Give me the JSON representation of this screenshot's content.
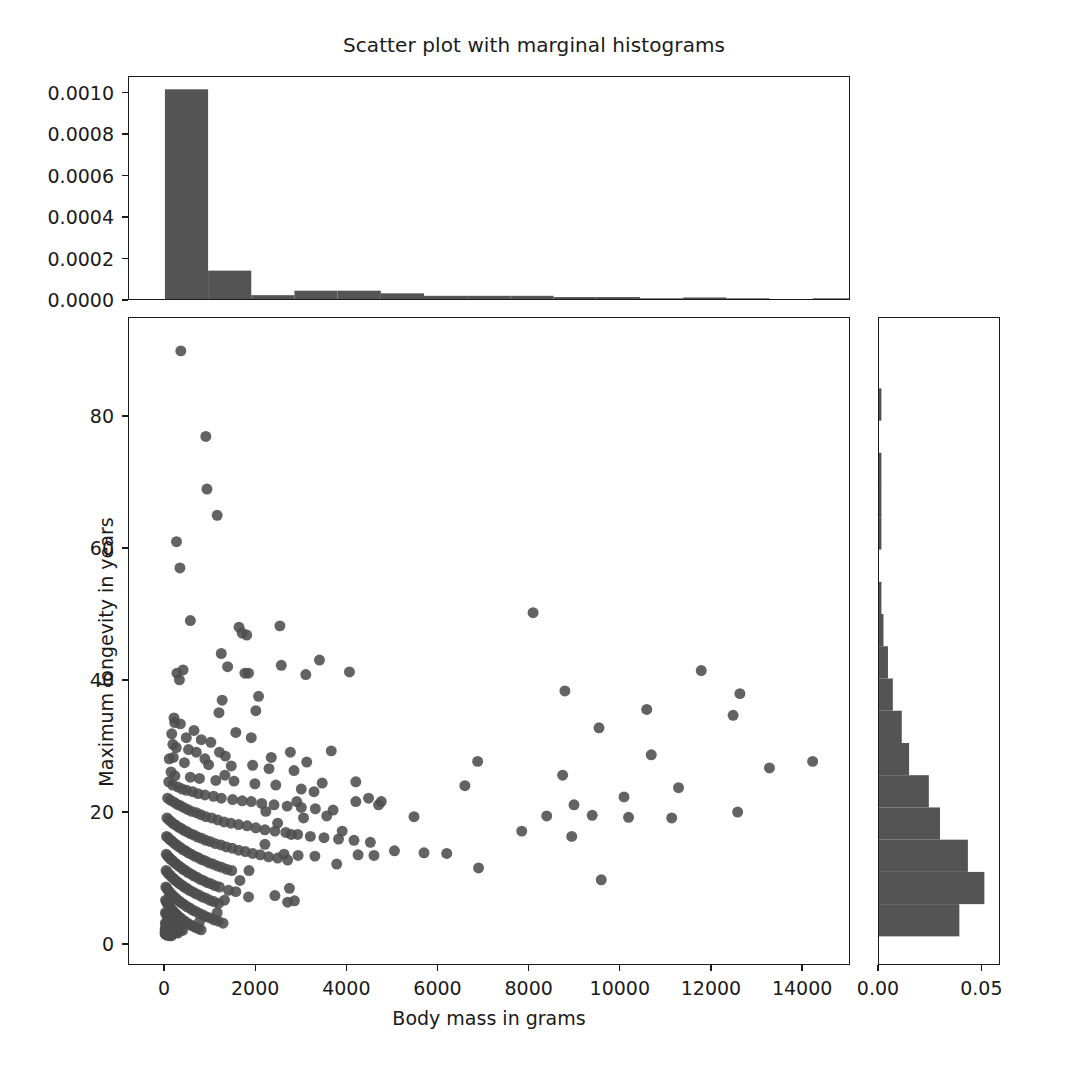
{
  "figure": {
    "title": "Scatter plot with marginal histograms",
    "background": "#ffffff",
    "marker_color": "#4d4d4d",
    "bar_color": "#545454",
    "axis_color": "#1a1a1a"
  },
  "main_axes": {
    "xlabel": "Body mass in grams",
    "ylabel": "Maximum longevity in years",
    "xticks": [
      "0",
      "2000",
      "4000",
      "6000",
      "8000",
      "10000",
      "12000",
      "14000"
    ],
    "yticks": [
      "0",
      "20",
      "40",
      "60",
      "80"
    ]
  },
  "top_axes": {
    "yticks": [
      "0.0000",
      "0.0002",
      "0.0004",
      "0.0006",
      "0.0008",
      "0.0010"
    ]
  },
  "right_axes": {
    "xticks": [
      "0.00",
      "0.05"
    ]
  },
  "chart_data": {
    "type": "scatter",
    "title": "Scatter plot with marginal histograms",
    "xlabel": "Body mass in grams",
    "ylabel": "Maximum longevity in years",
    "xlim": [
      -790,
      15050
    ],
    "ylim": [
      -3.2,
      95.0
    ],
    "grid": false,
    "legend": null,
    "marker_color": "#4d4d4d",
    "marker_size": 11,
    "points": [
      [
        350,
        90.0
      ],
      [
        900,
        77.0
      ],
      [
        925,
        69.0
      ],
      [
        1150,
        65.0
      ],
      [
        255,
        61.0
      ],
      [
        330,
        57.0
      ],
      [
        8100,
        50.2
      ],
      [
        560,
        49.0
      ],
      [
        1630,
        48.0
      ],
      [
        2530,
        48.2
      ],
      [
        1700,
        47.1
      ],
      [
        1800,
        46.8
      ],
      [
        1240,
        44.0
      ],
      [
        11800,
        41.4
      ],
      [
        1380,
        42.0
      ],
      [
        1760,
        41.0
      ],
      [
        1840,
        41.0
      ],
      [
        265,
        41.0
      ],
      [
        400,
        41.5
      ],
      [
        320,
        40.0
      ],
      [
        8800,
        38.3
      ],
      [
        12650,
        37.9
      ],
      [
        1260,
        36.9
      ],
      [
        1190,
        35.0
      ],
      [
        10600,
        35.5
      ],
      [
        12500,
        34.6
      ],
      [
        200,
        34.2
      ],
      [
        215,
        33.5
      ],
      [
        340,
        33.3
      ],
      [
        9550,
        32.7
      ],
      [
        640,
        32.3
      ],
      [
        150,
        31.8
      ],
      [
        470,
        31.2
      ],
      [
        800,
        30.9
      ],
      [
        1010,
        30.5
      ],
      [
        175,
        30.2
      ],
      [
        250,
        29.7
      ],
      [
        520,
        29.4
      ],
      [
        690,
        29.0
      ],
      [
        1330,
        28.4
      ],
      [
        10700,
        28.6
      ],
      [
        6880,
        27.6
      ],
      [
        14250,
        27.6
      ],
      [
        13300,
        26.6
      ],
      [
        185,
        28.2
      ],
      [
        95,
        28.0
      ],
      [
        430,
        27.4
      ],
      [
        960,
        27.1
      ],
      [
        1460,
        26.9
      ],
      [
        1930,
        27.0
      ],
      [
        2290,
        26.5
      ],
      [
        2840,
        26.2
      ],
      [
        8750,
        25.5
      ],
      [
        6600,
        23.9
      ],
      [
        135,
        26.0
      ],
      [
        220,
        25.4
      ],
      [
        560,
        25.2
      ],
      [
        760,
        25.0
      ],
      [
        1120,
        24.7
      ],
      [
        1520,
        24.6
      ],
      [
        1980,
        24.2
      ],
      [
        2440,
        24.0
      ],
      [
        3000,
        23.4
      ],
      [
        3280,
        23.0
      ],
      [
        3460,
        24.3
      ],
      [
        11300,
        23.6
      ],
      [
        10100,
        22.2
      ],
      [
        9000,
        21.0
      ],
      [
        85,
        24.5
      ],
      [
        170,
        24.0
      ],
      [
        290,
        23.7
      ],
      [
        380,
        23.4
      ],
      [
        480,
        23.2
      ],
      [
        610,
        23.0
      ],
      [
        730,
        22.7
      ],
      [
        880,
        22.5
      ],
      [
        1070,
        22.3
      ],
      [
        1240,
        22.0
      ],
      [
        1490,
        21.8
      ],
      [
        1700,
        21.6
      ],
      [
        1900,
        21.5
      ],
      [
        2130,
        21.2
      ],
      [
        2400,
        21.0
      ],
      [
        2690,
        20.8
      ],
      [
        3000,
        20.6
      ],
      [
        3310,
        20.4
      ],
      [
        3700,
        20.2
      ],
      [
        4200,
        21.5
      ],
      [
        4700,
        21.0
      ],
      [
        5480,
        19.2
      ],
      [
        7850,
        17.0
      ],
      [
        8400,
        19.3
      ],
      [
        8950,
        16.2
      ],
      [
        9400,
        19.4
      ],
      [
        9600,
        9.6
      ],
      [
        10200,
        19.1
      ],
      [
        11150,
        19.0
      ],
      [
        12600,
        19.9
      ],
      [
        60,
        22.0
      ],
      [
        120,
        21.7
      ],
      [
        200,
        21.4
      ],
      [
        265,
        21.1
      ],
      [
        330,
        20.9
      ],
      [
        410,
        20.6
      ],
      [
        500,
        20.3
      ],
      [
        590,
        20.0
      ],
      [
        690,
        19.8
      ],
      [
        790,
        19.5
      ],
      [
        900,
        19.2
      ],
      [
        1030,
        19.0
      ],
      [
        1160,
        18.7
      ],
      [
        1300,
        18.4
      ],
      [
        1450,
        18.2
      ],
      [
        1620,
        18.0
      ],
      [
        1810,
        17.8
      ],
      [
        2000,
        17.5
      ],
      [
        2200,
        17.2
      ],
      [
        2420,
        17.0
      ],
      [
        2660,
        16.8
      ],
      [
        2920,
        16.5
      ],
      [
        3200,
        16.2
      ],
      [
        3500,
        16.0
      ],
      [
        3820,
        15.8
      ],
      [
        4160,
        15.6
      ],
      [
        4520,
        15.3
      ],
      [
        5050,
        14.0
      ],
      [
        5700,
        13.7
      ],
      [
        6200,
        13.6
      ],
      [
        6900,
        11.4
      ],
      [
        3780,
        12.0
      ],
      [
        45,
        19.0
      ],
      [
        90,
        18.7
      ],
      [
        140,
        18.4
      ],
      [
        190,
        18.1
      ],
      [
        240,
        17.9
      ],
      [
        300,
        17.6
      ],
      [
        360,
        17.4
      ],
      [
        420,
        17.1
      ],
      [
        490,
        16.9
      ],
      [
        560,
        16.6
      ],
      [
        640,
        16.4
      ],
      [
        720,
        16.1
      ],
      [
        810,
        15.9
      ],
      [
        900,
        15.6
      ],
      [
        1000,
        15.4
      ],
      [
        1110,
        15.1
      ],
      [
        1230,
        14.9
      ],
      [
        1350,
        14.6
      ],
      [
        1480,
        14.4
      ],
      [
        1620,
        14.1
      ],
      [
        1770,
        13.9
      ],
      [
        1930,
        13.6
      ],
      [
        2100,
        13.4
      ],
      [
        2280,
        13.1
      ],
      [
        2480,
        12.9
      ],
      [
        2700,
        12.6
      ],
      [
        2930,
        13.3
      ],
      [
        35,
        16.2
      ],
      [
        70,
        16.0
      ],
      [
        110,
        15.7
      ],
      [
        150,
        15.5
      ],
      [
        195,
        15.2
      ],
      [
        240,
        15.0
      ],
      [
        290,
        14.7
      ],
      [
        340,
        14.5
      ],
      [
        395,
        14.2
      ],
      [
        455,
        14.0
      ],
      [
        515,
        13.7
      ],
      [
        580,
        13.5
      ],
      [
        650,
        13.2
      ],
      [
        725,
        13.0
      ],
      [
        800,
        12.7
      ],
      [
        880,
        12.5
      ],
      [
        965,
        12.2
      ],
      [
        1055,
        12.0
      ],
      [
        1150,
        11.7
      ],
      [
        1250,
        11.5
      ],
      [
        1360,
        11.2
      ],
      [
        1470,
        11.0
      ],
      [
        30,
        13.5
      ],
      [
        60,
        13.2
      ],
      [
        95,
        13.0
      ],
      [
        130,
        12.7
      ],
      [
        170,
        12.5
      ],
      [
        210,
        12.2
      ],
      [
        255,
        12.0
      ],
      [
        300,
        11.7
      ],
      [
        350,
        11.5
      ],
      [
        400,
        11.2
      ],
      [
        455,
        11.0
      ],
      [
        510,
        10.7
      ],
      [
        570,
        10.5
      ],
      [
        635,
        10.2
      ],
      [
        700,
        10.0
      ],
      [
        770,
        9.7
      ],
      [
        845,
        9.5
      ],
      [
        925,
        9.2
      ],
      [
        1010,
        9.0
      ],
      [
        1100,
        8.7
      ],
      [
        1200,
        8.5
      ],
      [
        25,
        11.0
      ],
      [
        50,
        10.8
      ],
      [
        80,
        10.5
      ],
      [
        115,
        10.3
      ],
      [
        150,
        10.0
      ],
      [
        190,
        9.8
      ],
      [
        230,
        9.5
      ],
      [
        275,
        9.3
      ],
      [
        320,
        9.0
      ],
      [
        370,
        8.8
      ],
      [
        425,
        8.5
      ],
      [
        480,
        8.3
      ],
      [
        540,
        8.0
      ],
      [
        605,
        7.8
      ],
      [
        675,
        7.5
      ],
      [
        745,
        7.3
      ],
      [
        820,
        7.0
      ],
      [
        900,
        6.8
      ],
      [
        985,
        6.5
      ],
      [
        1075,
        6.3
      ],
      [
        1180,
        6.0
      ],
      [
        1310,
        6.5
      ],
      [
        1560,
        7.8
      ],
      [
        1840,
        7.0
      ],
      [
        2420,
        7.2
      ],
      [
        2700,
        6.2
      ],
      [
        2850,
        6.4
      ],
      [
        20,
        8.5
      ],
      [
        42,
        8.3
      ],
      [
        68,
        8.0
      ],
      [
        96,
        7.8
      ],
      [
        128,
        7.5
      ],
      [
        162,
        7.3
      ],
      [
        200,
        7.0
      ],
      [
        240,
        6.8
      ],
      [
        283,
        6.5
      ],
      [
        330,
        6.3
      ],
      [
        380,
        6.0
      ],
      [
        432,
        5.8
      ],
      [
        488,
        5.5
      ],
      [
        548,
        5.3
      ],
      [
        610,
        5.0
      ],
      [
        678,
        4.8
      ],
      [
        750,
        4.5
      ],
      [
        825,
        4.3
      ],
      [
        905,
        4.0
      ],
      [
        990,
        3.8
      ],
      [
        1080,
        3.5
      ],
      [
        1175,
        3.3
      ],
      [
        1280,
        3.0
      ],
      [
        15,
        6.5
      ],
      [
        32,
        6.3
      ],
      [
        52,
        6.0
      ],
      [
        75,
        5.8
      ],
      [
        100,
        5.5
      ],
      [
        128,
        5.3
      ],
      [
        158,
        5.0
      ],
      [
        190,
        4.8
      ],
      [
        225,
        4.5
      ],
      [
        262,
        4.3
      ],
      [
        302,
        4.0
      ],
      [
        345,
        3.8
      ],
      [
        390,
        3.5
      ],
      [
        438,
        3.3
      ],
      [
        490,
        3.0
      ],
      [
        545,
        2.8
      ],
      [
        602,
        2.6
      ],
      [
        663,
        2.4
      ],
      [
        727,
        2.2
      ],
      [
        795,
        2.0
      ],
      [
        12,
        4.6
      ],
      [
        26,
        4.4
      ],
      [
        42,
        4.2
      ],
      [
        60,
        4.0
      ],
      [
        80,
        3.8
      ],
      [
        102,
        3.6
      ],
      [
        126,
        3.4
      ],
      [
        152,
        3.2
      ],
      [
        180,
        3.0
      ],
      [
        210,
        2.8
      ],
      [
        242,
        2.6
      ],
      [
        276,
        2.4
      ],
      [
        312,
        2.2
      ],
      [
        350,
        2.0
      ],
      [
        390,
        1.9
      ],
      [
        10,
        3.0
      ],
      [
        22,
        2.9
      ],
      [
        36,
        2.7
      ],
      [
        52,
        2.6
      ],
      [
        70,
        2.4
      ],
      [
        90,
        2.3
      ],
      [
        112,
        2.1
      ],
      [
        136,
        2.0
      ],
      [
        162,
        1.9
      ],
      [
        190,
        1.8
      ],
      [
        220,
        1.7
      ],
      [
        252,
        1.6
      ],
      [
        286,
        1.5
      ],
      [
        8,
        2.2
      ],
      [
        18,
        2.1
      ],
      [
        30,
        2.0
      ],
      [
        44,
        1.9
      ],
      [
        60,
        1.8
      ],
      [
        78,
        1.7
      ],
      [
        98,
        1.6
      ],
      [
        120,
        1.5
      ],
      [
        144,
        1.5
      ],
      [
        170,
        1.4
      ],
      [
        5,
        1.8
      ],
      [
        14,
        1.7
      ],
      [
        25,
        1.6
      ],
      [
        38,
        1.6
      ],
      [
        53,
        1.5
      ],
      [
        70,
        1.5
      ],
      [
        89,
        1.4
      ],
      [
        110,
        1.4
      ],
      [
        133,
        1.3
      ],
      [
        158,
        1.3
      ],
      [
        3,
        1.4
      ],
      [
        11,
        1.4
      ],
      [
        21,
        1.3
      ],
      [
        33,
        1.3
      ],
      [
        47,
        1.2
      ],
      [
        63,
        1.2
      ],
      [
        81,
        1.2
      ],
      [
        101,
        1.1
      ],
      [
        123,
        1.1
      ],
      [
        147,
        1.1
      ],
      [
        1200,
        29.0
      ],
      [
        880,
        28.0
      ],
      [
        2000,
        35.3
      ],
      [
        2060,
        37.5
      ],
      [
        2560,
        42.2
      ],
      [
        3100,
        40.8
      ],
      [
        3400,
        43.0
      ],
      [
        4060,
        41.2
      ],
      [
        4200,
        24.5
      ],
      [
        4480,
        22.0
      ],
      [
        4760,
        21.5
      ],
      [
        3560,
        19.3
      ],
      [
        3900,
        17.0
      ],
      [
        3660,
        29.2
      ],
      [
        3120,
        27.5
      ],
      [
        2760,
        29.0
      ],
      [
        2340,
        28.2
      ],
      [
        1900,
        31.2
      ],
      [
        1560,
        32.0
      ],
      [
        1320,
        25.5
      ],
      [
        2220,
        20.0
      ],
      [
        2480,
        18.2
      ],
      [
        2620,
        13.5
      ],
      [
        3300,
        13.2
      ],
      [
        4250,
        13.4
      ],
      [
        4600,
        13.3
      ],
      [
        2900,
        21.5
      ],
      [
        3050,
        19.0
      ],
      [
        2780,
        16.5
      ],
      [
        2200,
        15.0
      ],
      [
        1850,
        11.0
      ],
      [
        1650,
        9.5
      ],
      [
        1400,
        8.0
      ],
      [
        1150,
        4.6
      ],
      [
        760,
        3.2
      ],
      [
        2740,
        8.3
      ]
    ]
  },
  "top_hist_data": {
    "type": "bar",
    "orientation": "vertical",
    "ylabel": "",
    "xlim": [
      -790,
      15050
    ],
    "ylim": [
      0,
      0.00108
    ],
    "bin_edges": [
      0,
      950,
      1900,
      2850,
      3800,
      4750,
      5700,
      6650,
      7600,
      8550,
      9500,
      10450,
      11400,
      12350,
      13300,
      14250,
      15200
    ],
    "densities": [
      0.00102,
      0.000138,
      1.85e-05,
      4.05e-05,
      4.05e-05,
      2.75e-05,
      1.55e-05,
      1.55e-05,
      1.55e-05,
      9.5e-06,
      9.5e-06,
      3.5e-06,
      7.5e-06,
      3.5e-06,
      0.0,
      3.5e-06
    ]
  },
  "right_hist_data": {
    "type": "bar",
    "orientation": "horizontal",
    "xlim": [
      0,
      0.059
    ],
    "ylim": [
      -3.2,
      95.0
    ],
    "bin_edges": [
      1.0,
      5.9,
      10.8,
      15.7,
      20.6,
      25.5,
      30.4,
      35.3,
      40.2,
      45.1,
      50.0,
      54.9,
      59.8,
      64.7,
      69.6,
      74.5,
      79.4,
      84.3,
      89.2
    ],
    "densities": [
      0.0395,
      0.0518,
      0.0437,
      0.03,
      0.0245,
      0.0148,
      0.0112,
      0.0068,
      0.0044,
      0.0022,
      0.0012,
      0.0,
      0.0012,
      0.0012,
      0.0012,
      0.0,
      0.0012,
      0.0,
      0.0012
    ]
  }
}
